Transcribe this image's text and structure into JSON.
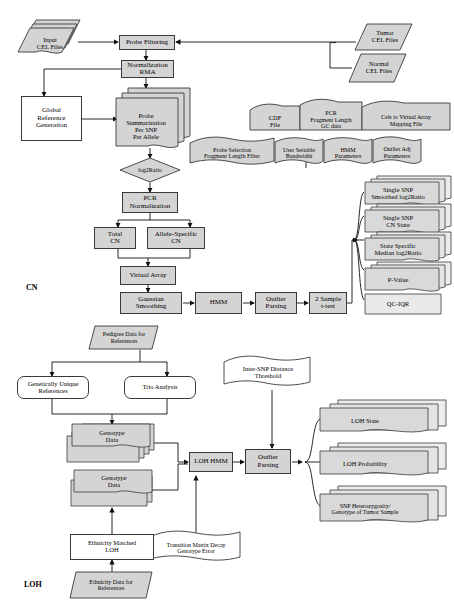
{
  "diagram": {
    "section_labels": [
      {
        "id": "cn",
        "text": "CN"
      },
      {
        "id": "loh",
        "text": "LOH"
      }
    ],
    "colors": {
      "node_fill": "#d4d4d4",
      "white_fill": "#ffffff",
      "stroke": "#3a3a3a",
      "text": "#000000"
    },
    "nodes": {
      "input_cel_files": {
        "label": "Input\nCEL Files",
        "shape": "data-stack"
      },
      "tumor_cel_files": {
        "label": "Tumor\nCEL Files",
        "shape": "data"
      },
      "normal_cel_files": {
        "label": "Normal\nCEL Files",
        "shape": "data"
      },
      "probe_filtering": {
        "label": "Probe Filtering",
        "shape": "process"
      },
      "normalization_rma": {
        "label": "Normalization\nRMA",
        "shape": "process"
      },
      "global_reference_generation": {
        "label": "Global\nReference\nGeneration",
        "shape": "process-white"
      },
      "probe_summarization": {
        "label": "Probe\nSummarization\nPer SNP\nPer Allele",
        "shape": "document-stack"
      },
      "log2ratio": {
        "label": "log2Ratio",
        "shape": "diamond"
      },
      "pcr_normalization": {
        "label": "PCR\nNormalization",
        "shape": "process"
      },
      "total_cn": {
        "label": "Total\nCN",
        "shape": "process"
      },
      "allele_specific_cn": {
        "label": "Allele-Specific\nCN",
        "shape": "process"
      },
      "virtual_array": {
        "label": "Virtual Array",
        "shape": "process"
      },
      "gaussian_smoothing": {
        "label": "Gaussian\nSmoothing",
        "shape": "process"
      },
      "hmm": {
        "label": "HMM",
        "shape": "process"
      },
      "outlier_parsing_cn": {
        "label": "Outlier\nParsing",
        "shape": "process"
      },
      "two_sample_ttest": {
        "label": "2 Sample\nt-test",
        "shape": "process"
      },
      "cdf_file": {
        "label": "CDF\nFile",
        "shape": "document"
      },
      "pcr_fragment_length_gc": {
        "label": "PCR\nFragment Length\nGC data",
        "shape": "document"
      },
      "cels_to_virtual_array": {
        "label": "Cels to Virtual Array\nMapping File",
        "shape": "document"
      },
      "probe_selection_filter": {
        "label": "Probe Selection\nFragment Length Filter",
        "shape": "document"
      },
      "user_settable_bandwidth": {
        "label": "User Settable\nBandwidth",
        "shape": "document"
      },
      "hmm_parameters": {
        "label": "HMM\nParameters",
        "shape": "document"
      },
      "outlier_adj_parameters": {
        "label": "Outlier Adj\nParameters",
        "shape": "document"
      },
      "single_snp_smoothed_log2ratio": {
        "label": "Single SNP\nSmoothed log2Ratio",
        "shape": "document-stack"
      },
      "single_snp_cn_state": {
        "label": "Single SNP\nCN State",
        "shape": "document-stack"
      },
      "state_specific_median_log2ratio": {
        "label": "State Specific\nMedian log2Ratio",
        "shape": "document-stack"
      },
      "p_value": {
        "label": "P-Value",
        "shape": "document-stack"
      },
      "qc_iqr": {
        "label": "QC-IQR",
        "shape": "document"
      },
      "pedigree_data_for_references": {
        "label": "Pedigree Data for\nReferences",
        "shape": "data"
      },
      "genetically_unique_references": {
        "label": "Genetically Unique\nReferences",
        "shape": "rounded"
      },
      "trio_analysis": {
        "label": "Trio Analysis",
        "shape": "rounded"
      },
      "genotype_data_1": {
        "label": "Genotype\nData",
        "shape": "data-stack"
      },
      "genotype_data_2": {
        "label": "Genotype\nData",
        "shape": "data-stack"
      },
      "loh_hmm": {
        "label": "LOH HMM",
        "shape": "process"
      },
      "outlier_parsing_loh": {
        "label": "Outlier\nParsing",
        "shape": "process"
      },
      "inter_snp_distance_threshold": {
        "label": "Inter-SNP Distance\nThreshold",
        "shape": "document"
      },
      "transition_matrix_decay": {
        "label": "Transition Matrix Decay\nGenotype Error",
        "shape": "document"
      },
      "ethnicity_matched_loh": {
        "label": "Ethnicity Matched\nLOH",
        "shape": "process-white"
      },
      "ethnicity_data_for_references": {
        "label": "Ethnicity Data for\nReferences",
        "shape": "data"
      },
      "loh_state": {
        "label": "LOH State",
        "shape": "document-stack"
      },
      "loh_probability": {
        "label": "LOH Probability",
        "shape": "document-stack"
      },
      "snp_heterozygosity": {
        "label": "SNP Heterozygosity/\nGenotype of Tumor Sample",
        "shape": "document-stack"
      }
    }
  }
}
